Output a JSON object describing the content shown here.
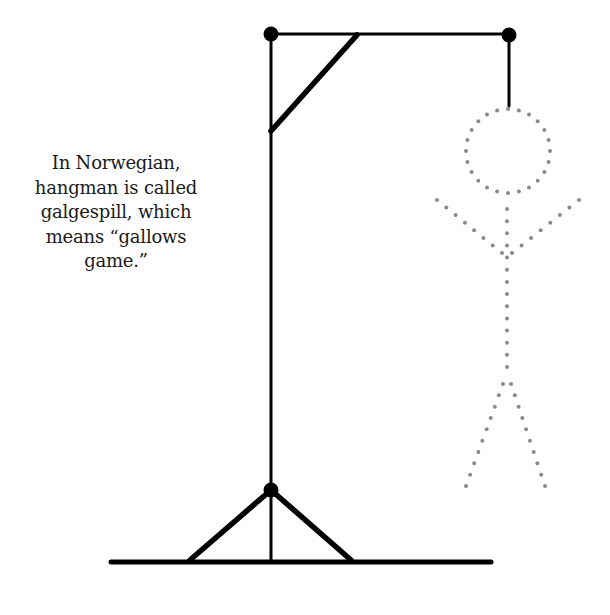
{
  "fact": {
    "lines": [
      "In Norwegian,",
      "hangman is called",
      "galgespill, which",
      "means “gallows",
      "game.”"
    ]
  },
  "colors": {
    "gallows": "#000000",
    "figure_dots": "#8a8a8a",
    "text": "#1a1a1a",
    "background": "#ffffff"
  },
  "gallows": {
    "ground": {
      "x1": 111,
      "y1": 562,
      "x2": 491,
      "y2": 562
    },
    "post": {
      "x1": 271,
      "y1": 34,
      "x2": 271,
      "y2": 562
    },
    "beam": {
      "x1": 271,
      "y1": 34,
      "x2": 509,
      "y2": 34
    },
    "brace": {
      "x1": 357,
      "y1": 35,
      "x2": 271,
      "y2": 131
    },
    "base_left": {
      "x1": 271,
      "y1": 490,
      "x2": 190,
      "y2": 560
    },
    "base_right": {
      "x1": 271,
      "y1": 490,
      "x2": 351,
      "y2": 560
    },
    "rope": {
      "x1": 509,
      "y1": 35,
      "x2": 509,
      "y2": 106
    },
    "joints": [
      {
        "cx": 271,
        "cy": 34,
        "r": 7.5
      },
      {
        "cx": 509,
        "cy": 35,
        "r": 7.5
      },
      {
        "cx": 271,
        "cy": 490,
        "r": 7.5
      }
    ]
  },
  "figure": {
    "head": {
      "cx": 508,
      "cy": 151,
      "r": 42,
      "dot_count": 24
    },
    "body": {
      "x1": 507,
      "y1": 209,
      "x2": 507,
      "y2": 367
    },
    "arm_left": {
      "x1": 437,
      "y1": 200,
      "x2": 502,
      "y2": 253
    },
    "arm_right": {
      "x1": 579,
      "y1": 200,
      "x2": 512,
      "y2": 253
    },
    "leg_left": {
      "x1": 503,
      "y1": 384,
      "x2": 466,
      "y2": 486
    },
    "leg_right": {
      "x1": 511,
      "y1": 384,
      "x2": 545,
      "y2": 486
    }
  }
}
